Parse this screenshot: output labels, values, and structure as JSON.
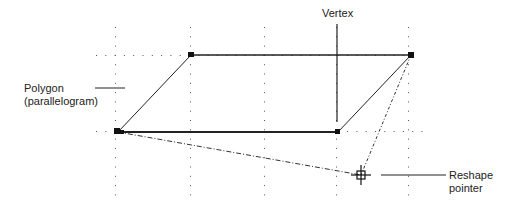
{
  "labels": {
    "polygon_line1": "Polygon",
    "polygon_line2": "(parallelogram)",
    "vertex": "Vertex",
    "reshape_line1": "Reshape",
    "reshape_line2": "pointer"
  },
  "colors": {
    "stroke": "#222222",
    "grid_dot": "#555555",
    "background": "#ffffff"
  },
  "shape": {
    "type": "parallelogram",
    "vertices": [
      [
        118,
        132
      ],
      [
        191,
        55
      ],
      [
        411,
        55
      ],
      [
        338,
        132
      ]
    ],
    "dragged_vertex_index": 0,
    "reshape_pointer": [
      361,
      175
    ]
  }
}
